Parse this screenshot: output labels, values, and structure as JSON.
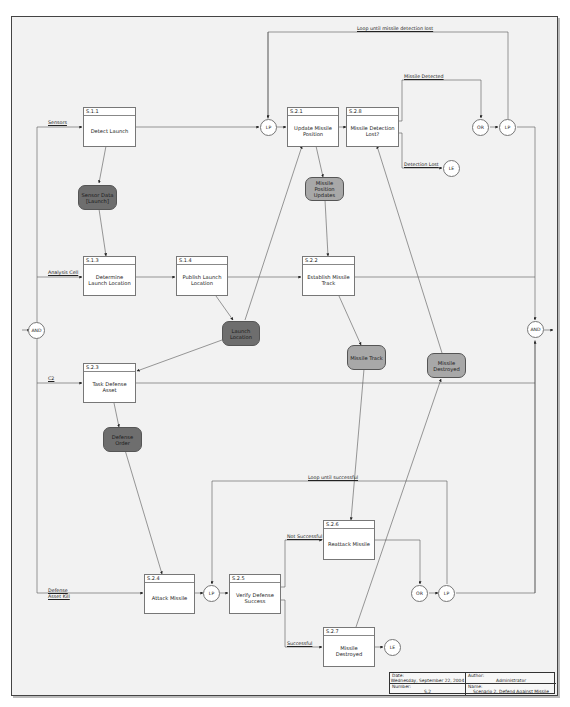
{
  "diagram": {
    "title_block": {
      "date_label": "Date:",
      "date_value": "Wednesday, September 22, 2004",
      "author_label": "Author:",
      "author_value": "Administrator",
      "number_label": "Number:",
      "number_value": "S.2",
      "name_label": "Name:",
      "name_value": "Scenario 2. Defend Against Missile"
    },
    "processes": [
      {
        "id": "S.1.1",
        "label": "Detect Launch"
      },
      {
        "id": "S.1.3",
        "label": "Determine Launch Location"
      },
      {
        "id": "S.1.4",
        "label": "Publish Launch Location"
      },
      {
        "id": "S.2.1",
        "label": "Update Missile Position"
      },
      {
        "id": "S.2.8",
        "label": "Missile Detection Lost?"
      },
      {
        "id": "S.2.2",
        "label": "Establish Missile Track"
      },
      {
        "id": "S.2.3",
        "label": "Task Defense Asset"
      },
      {
        "id": "S.2.4",
        "label": "Attack Missile"
      },
      {
        "id": "S.2.5",
        "label": "Verify Defense Success"
      },
      {
        "id": "S.2.6",
        "label": "Reattack Missile"
      },
      {
        "id": "S.2.7",
        "label": "Missile Destroyed"
      }
    ],
    "items": [
      {
        "label": "Sensor Data [Launch]",
        "shade": "dark"
      },
      {
        "label": "Launch Location",
        "shade": "dark"
      },
      {
        "label": "Defense Order",
        "shade": "dark"
      },
      {
        "label": "Missile Position Updates",
        "shade": "light"
      },
      {
        "label": "Missile Track",
        "shade": "light"
      },
      {
        "label": "Missile Destroyed",
        "shade": "light"
      }
    ],
    "junctions": [
      {
        "label": "AND"
      },
      {
        "label": "AND"
      },
      {
        "label": "LP"
      },
      {
        "label": "OR"
      },
      {
        "label": "LP"
      },
      {
        "label": "LE"
      },
      {
        "label": "LP"
      },
      {
        "label": "OR"
      },
      {
        "label": "LP"
      },
      {
        "label": "LE"
      }
    ],
    "edge_labels": {
      "sensors": "Sensors",
      "analysis_cell": "Analysis Cell",
      "c2": "C2",
      "defense_asset_kill": "Defense Asset Kill",
      "loop_detection": "Loop until missile detection lost",
      "missile_detected": "Missile Detected",
      "detection_lost": "Detection Lost",
      "loop_successful": "Loop until successful",
      "not_successful": "Not Successful",
      "successful": "Successful"
    },
    "colors": {
      "background": "#f2f2f2",
      "dark_item": "#6e6e6e",
      "light_item": "#a8a8a8",
      "line": "#555555"
    }
  }
}
